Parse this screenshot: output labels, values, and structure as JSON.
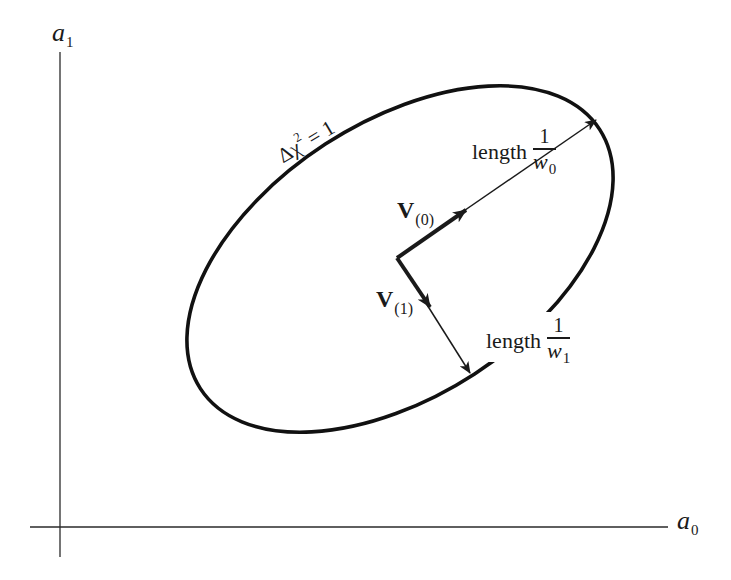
{
  "figure": {
    "type": "error-ellipse-diagram",
    "axes": {
      "x_label": "a",
      "x_label_subscript": "0",
      "y_label": "a",
      "y_label_subscript": "1"
    },
    "ellipse": {
      "label_prefix": "Δχ",
      "label_superscript": "2",
      "label_suffix": " = 1"
    },
    "vectors": [
      {
        "name": "V",
        "subscript": "(0)",
        "length_text": "length",
        "length_numerator": "1",
        "length_denominator": "w",
        "length_denominator_subscript": "0"
      },
      {
        "name": "V",
        "subscript": "(1)",
        "length_text": "length",
        "length_numerator": "1",
        "length_denominator": "w",
        "length_denominator_subscript": "1"
      }
    ],
    "colors": {
      "ink": "#1a1a1a",
      "background": "#ffffff"
    }
  }
}
